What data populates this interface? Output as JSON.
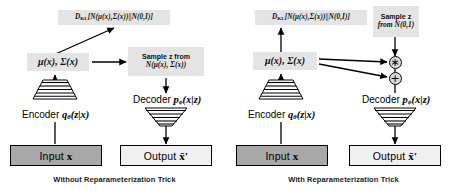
{
  "figure": {
    "panels": [
      {
        "id": "without-trick",
        "caption": "Without Reparameterization Trick",
        "kl_box": {
          "prefix": "D",
          "sub": "KL",
          "body": "[N(μ(x),Σ(x))||N(0,I)]"
        },
        "latent_box": "μ(x), Σ(x)",
        "sample_box": {
          "line1": "Sample z from",
          "line2": "N(μ(x), Σ(x))"
        },
        "encoder_label": "Encoder",
        "encoder_fn": "q",
        "encoder_fn_sub": "θ",
        "encoder_fn_args": "(z|x)",
        "decoder_label": "Decoder",
        "decoder_fn": "p",
        "decoder_fn_sub": "ϕ",
        "decoder_fn_args": "(x|z)",
        "input_label": "Input",
        "input_var": "x",
        "output_label": "Output",
        "output_var": "x̄′"
      },
      {
        "id": "with-trick",
        "caption": "With Reparameterization Trick",
        "kl_box": {
          "prefix": "D",
          "sub": "KL",
          "body": "[N(μ(x),Σ(x))||N(0,I)]"
        },
        "latent_box": "μ(x), Σ(x)",
        "sample_box": {
          "line1": "Sample z",
          "line2": "from N(0,1)"
        },
        "multiply_op": "∗",
        "add_op": "+",
        "encoder_label": "Encoder",
        "encoder_fn": "q",
        "encoder_fn_sub": "θ",
        "encoder_fn_args": "(z|x)",
        "decoder_label": "Decoder",
        "decoder_fn": "p",
        "decoder_fn_sub": "ϕ",
        "decoder_fn_args": "(x|z)",
        "input_label": "Input",
        "input_var": "x",
        "output_label": "Output",
        "output_var": "x̄′"
      }
    ],
    "colors": {
      "shade": "#e4e4e4",
      "input_fill": "#a8a8a8",
      "output_fill": "#f0f0f0",
      "stroke": "#000000",
      "background": "#ffffff"
    }
  }
}
